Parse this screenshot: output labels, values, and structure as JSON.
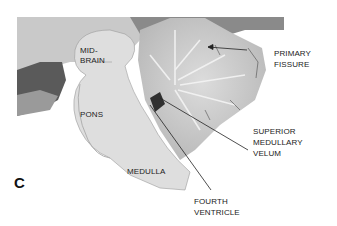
{
  "figure": {
    "panel_letter": "C",
    "labels": {
      "midbrain_1": "MID-",
      "midbrain_2": "BRAIN",
      "pons": "PONS",
      "medulla": "MEDULLA",
      "primary_fissure_1": "PRIMARY",
      "primary_fissure_2": "FISSURE",
      "smv_1": "SUPERIOR",
      "smv_2": "MEDULLARY",
      "smv_3": "VELUM",
      "fourth_1": "FOURTH",
      "fourth_2": "VENTRICLE"
    }
  }
}
